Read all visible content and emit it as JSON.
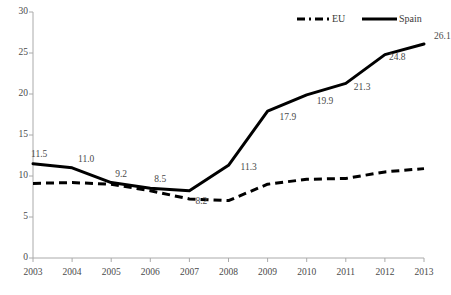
{
  "chart_data": {
    "type": "line",
    "title": "",
    "subtitle": "",
    "xlabel": "",
    "ylabel": "",
    "categories": [
      "2003",
      "2004",
      "2005",
      "2006",
      "2007",
      "2008",
      "2009",
      "2010",
      "2011",
      "2012",
      "2013"
    ],
    "xlim": [
      2003,
      2013
    ],
    "ylim": [
      0,
      30
    ],
    "yticks": [
      "0",
      "5",
      "10",
      "15",
      "20",
      "25",
      "30"
    ],
    "ytick_values": [
      0,
      5,
      10,
      15,
      20,
      25,
      30
    ],
    "grid": false,
    "legend_position": "top-right",
    "series": [
      {
        "name": "EU",
        "style": "dashed",
        "color": "#000000",
        "values": [
          9.1,
          9.2,
          9.0,
          8.2,
          7.2,
          7.0,
          9.0,
          9.6,
          9.7,
          10.5,
          10.9
        ],
        "labels": []
      },
      {
        "name": "Spain",
        "style": "solid",
        "color": "#000000",
        "values": [
          11.5,
          11.0,
          9.2,
          8.5,
          8.2,
          11.3,
          17.9,
          19.9,
          21.3,
          24.8,
          26.1
        ],
        "labels": [
          "11.5",
          "11.0",
          "9.2",
          "8.5",
          "8.2",
          "11.3",
          "17.9",
          "19.9",
          "21.3",
          "24.8",
          "26.1"
        ]
      }
    ],
    "annotations": [
      {
        "text": "11.5",
        "x": 2003,
        "y": 11.5
      },
      {
        "text": "11.0",
        "x": 2004,
        "y": 11.0
      },
      {
        "text": "9.2",
        "x": 2005,
        "y": 9.2
      },
      {
        "text": "8.5",
        "x": 2006,
        "y": 8.5
      },
      {
        "text": "8.2",
        "x": 2007,
        "y": 8.2
      },
      {
        "text": "11.3",
        "x": 2008,
        "y": 11.3
      },
      {
        "text": "17.9",
        "x": 2009,
        "y": 17.9
      },
      {
        "text": "19.9",
        "x": 2010,
        "y": 19.9
      },
      {
        "text": "21.3",
        "x": 2011,
        "y": 21.3
      },
      {
        "text": "24.8",
        "x": 2012,
        "y": 24.8
      },
      {
        "text": "26.1",
        "x": 2013,
        "y": 26.1
      }
    ]
  },
  "legend": {
    "items": [
      {
        "label": "EU",
        "style": "dashed"
      },
      {
        "label": "Spain",
        "style": "solid"
      }
    ]
  },
  "axes": {
    "y": {
      "labels": [
        "30",
        "25",
        "20",
        "15",
        "10",
        "5",
        "0"
      ]
    },
    "x": {
      "labels": [
        "2003",
        "2004",
        "2005",
        "2006",
        "2007",
        "2008",
        "2009",
        "2010",
        "2011",
        "2012",
        "2013"
      ]
    }
  },
  "colors": {
    "line": "#000000",
    "axis": "#aaaaaa",
    "text": "#4a4a4a",
    "background": "#ffffff"
  }
}
